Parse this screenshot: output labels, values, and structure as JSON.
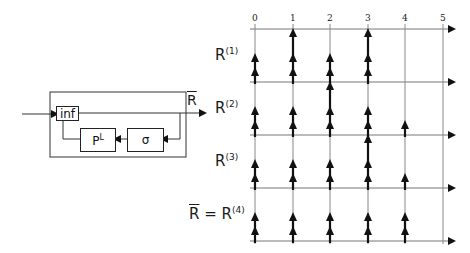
{
  "block_diagram": {
    "inf_label": "inf",
    "pl_label": "P",
    "pl_sup": "L",
    "sigma_label": "σ",
    "output_label": "R"
  },
  "grid": {
    "tick_labels": [
      "0",
      "1",
      "2",
      "3",
      "4",
      "5"
    ],
    "rows": [
      {
        "label": "R",
        "sup": "(1)",
        "prefix": "",
        "arrows": [
          2,
          3,
          2,
          3,
          0
        ]
      },
      {
        "label": "R",
        "sup": "(2)",
        "prefix": "",
        "arrows": [
          2,
          2,
          3,
          2,
          1
        ]
      },
      {
        "label": "R",
        "sup": "(3)",
        "prefix": "",
        "arrows": [
          2,
          2,
          2,
          3,
          1
        ]
      },
      {
        "label": "R",
        "sup": "(4)",
        "prefix": "R = ",
        "arrows": [
          2,
          2,
          2,
          2,
          2
        ]
      }
    ]
  },
  "colors": {
    "line": "#333333",
    "arrow": "#111111",
    "grid": "#888888"
  }
}
